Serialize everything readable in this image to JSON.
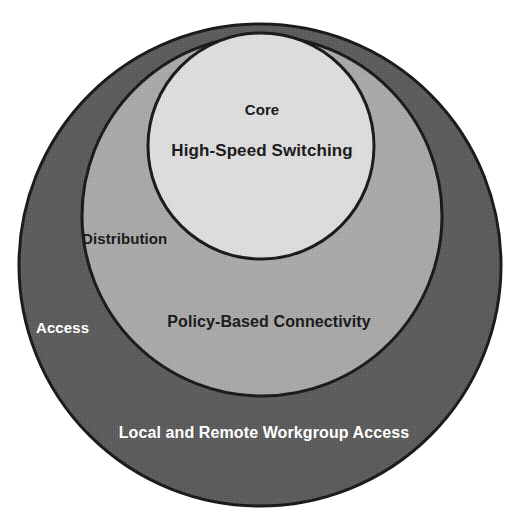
{
  "diagram": {
    "type": "concentric-circles",
    "background_color": "#ffffff",
    "layers": [
      {
        "id": "access",
        "name": "Access",
        "label": "Access",
        "description": "Local and Remote Workgroup Access",
        "fill_color": "#5b5b5b",
        "stroke_color": "#1a1a1a",
        "label_color": "#ffffff",
        "level": 3
      },
      {
        "id": "distribution",
        "name": "Distribution",
        "label": "Distribution",
        "description": "Policy-Based Connectivity",
        "fill_color": "#a9a9a9",
        "stroke_color": "#1a1a1a",
        "label_color": "#1b1b1b",
        "level": 2
      },
      {
        "id": "core",
        "name": "Core",
        "label": "Core",
        "description": "High-Speed Switching",
        "fill_color": "#dedede",
        "stroke_color": "#1a1a1a",
        "label_color": "#1b1b1b",
        "level": 1
      }
    ]
  },
  "geometry": {
    "access_circle": {
      "cx": 260,
      "cy": 265,
      "r": 241
    },
    "distribution_circle": {
      "cx": 262,
      "cy": 216,
      "r": 180
    },
    "core_circle": {
      "cx": 261,
      "cy": 146,
      "r": 113
    }
  }
}
